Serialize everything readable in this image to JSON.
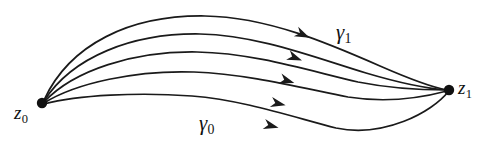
{
  "figure": {
    "kind": "mathematical-diagram",
    "background_color": "#ffffff",
    "ink_color": "#1a1a1a",
    "width": 500,
    "height": 153
  },
  "nodes": [
    {
      "id": "z0",
      "label_base": "z",
      "label_sub": "0",
      "point": {
        "x": 42,
        "y": 103
      },
      "radius": 5.2,
      "label_pos": {
        "x": 14,
        "y": 103
      }
    },
    {
      "id": "z1",
      "label_base": "z",
      "label_sub": "1",
      "point": {
        "x": 449,
        "y": 90
      },
      "radius": 5.2,
      "label_pos": {
        "x": 458,
        "y": 78
      }
    }
  ],
  "curve_labels": [
    {
      "id": "gamma1",
      "label_base": "γ",
      "label_sub": "1",
      "label_pos": {
        "x": 336,
        "y": 22
      },
      "annotates_curve": 0
    },
    {
      "id": "gamma0",
      "label_base": "γ",
      "label_sub": "0",
      "label_pos": {
        "x": 199,
        "y": 113
      },
      "annotates_curve": 4
    }
  ],
  "curves": [
    {
      "id": "curve-gamma1",
      "d": "M 44 100 C 70 44 130 15 205 16 C 268 17 330 44 380 66 C 412 80 436 88 447 90",
      "arrow": {
        "x": 296,
        "y": 31.5,
        "angle": 25
      }
    },
    {
      "id": "curve-2",
      "d": "M 44 101 C 72 57 132 33 200 34 C 258 35 316 58 366 73 C 403 84 433 89 447 90",
      "arrow": {
        "x": 288,
        "y": 55,
        "angle": 21
      }
    },
    {
      "id": "curve-3",
      "d": "M 44 102 C 74 70 134 51 197 52 C 254 53 310 71 358 82 C 398 90 432 90 447 90",
      "arrow": {
        "x": 280,
        "y": 78.5,
        "angle": 17
      }
    },
    {
      "id": "curve-4",
      "d": "M 44 103 C 76 83 136 70 194 72 C 248 74 302 88 348 97 C 392 104 432 95 447 91",
      "arrow": {
        "x": 271,
        "y": 102,
        "angle": 13
      }
    },
    {
      "id": "curve-gamma0",
      "d": "M 44 104 C 78 95 138 92 192 96 C 244 100 296 118 336 128 C 384 138 432 112 448 92",
      "arrow": {
        "x": 264,
        "y": 124,
        "angle": 14
      }
    }
  ]
}
